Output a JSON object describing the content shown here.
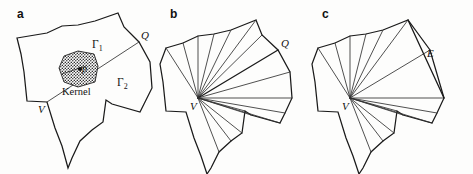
{
  "figure": {
    "background_color": "#fdfdfc",
    "stroke_color": "#1a1a1a",
    "panels": [
      {
        "id": "a",
        "letter": "a",
        "letter_pos": [
          17,
          18
        ],
        "description": "Simple polygon with shaded kernel region, boundary chains Gamma1 and Gamma2 separated by the diagonal from V to Q",
        "outline": "17,38 47,33 62,26 78,25 95,21 118,13 124,27 139,42 150,62 152,88 145,102 140,112 112,104 106,100 103,122 92,130 80,141 72,158 68,168 62,146 55,128 47,102 27,101 24,72 21,54",
        "diagonal": "47,102 139,42",
        "labels": [
          {
            "name": "gamma-1",
            "text": "Γ",
            "sub": "1",
            "x": 92,
            "y": 48
          },
          {
            "name": "gamma-2",
            "text": "Γ",
            "sub": "2",
            "x": 117,
            "y": 86
          },
          {
            "name": "vertex-v",
            "text": "V",
            "x": 38,
            "y": 113
          },
          {
            "name": "vertex-q",
            "text": "Q",
            "x": 141,
            "y": 39
          },
          {
            "name": "kernel-caption",
            "text": "Kernel",
            "x": 62,
            "y": 95
          },
          {
            "name": "point-p",
            "text": "p",
            "x": 82,
            "y": 72
          }
        ],
        "kernel": {
          "name": "kernel-region",
          "polygon": "64,56 78,51 94,54 98,66 95,82 78,87 64,82 59,68",
          "fill_pattern": "stipple-dots",
          "fill_color": "#2a2a2a",
          "point": [
            80,
            69
          ]
        }
      },
      {
        "id": "b",
        "letter": "b",
        "letter_pos": [
          170,
          18
        ],
        "description": "Same polygon triangulated as a fan from vertex V, with all diagonals emanating from V",
        "outline": "166,48 183,43 198,36 214,34 231,30 256,20 262,35 278,50 290,72 292,98 285,113 280,123 251,115 245,111 242,133 231,141 219,152 211,168 207,174 201,156 194,138 186,112 166,111 163,82 160,64",
        "fan_from": [
          198,
          98
        ],
        "fan_to": [
          "166,48",
          "183,43",
          "198,36",
          "214,34",
          "231,30",
          "256,20",
          "262,35",
          "278,50",
          "290,72",
          "292,98",
          "285,113",
          "280,123",
          "251,115",
          "245,111",
          "242,133",
          "231,141",
          "219,152"
        ],
        "bold_chord": "198,98 278,50",
        "labels": [
          {
            "name": "vertex-v",
            "text": "V",
            "x": 190,
            "y": 110
          },
          {
            "name": "vertex-q",
            "text": "Q",
            "x": 281,
            "y": 47
          }
        ]
      },
      {
        "id": "c",
        "letter": "c",
        "letter_pos": [
          322,
          18
        ],
        "description": "Same polygon with fan triangulation from V and a highlighted long edge E on the right boundary",
        "outline": "318,48 335,43 350,36 366,34 383,30 408,20 414,35 430,50 442,72 444,98 437,113 432,123 403,115 397,111 394,133 383,141 371,152 363,168 359,174 353,156 346,138 338,112 318,111 315,82 312,64",
        "fan_from": [
          350,
          98
        ],
        "fan_to": [
          "318,48",
          "335,43",
          "350,36",
          "366,34",
          "383,30",
          "408,20",
          "430,50",
          "444,98",
          "437,113",
          "432,123",
          "403,115",
          "397,111",
          "394,133",
          "383,141",
          "371,152"
        ],
        "edge_e": "408,20 444,98",
        "labels": [
          {
            "name": "vertex-v",
            "text": "V",
            "x": 342,
            "y": 110
          },
          {
            "name": "edge-e",
            "text": "E",
            "x": 427,
            "y": 57
          }
        ]
      }
    ]
  }
}
